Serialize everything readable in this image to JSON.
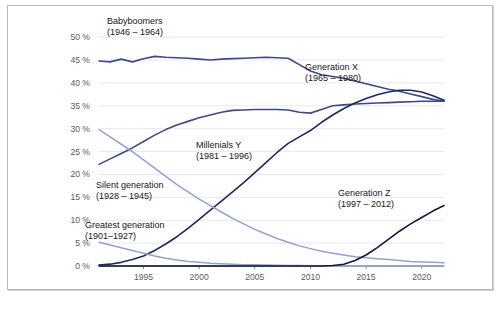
{
  "figure": {
    "background": "#ffffff",
    "frame_color": "#b9b9b9"
  },
  "chart_data": {
    "type": "line",
    "title": "",
    "subtitle": "",
    "xlabel": "",
    "ylabel": "",
    "xlim": [
      1991,
      2022
    ],
    "ylim": [
      0,
      52
    ],
    "grid": true,
    "legend_position": "inline-annotations",
    "y_ticks": [
      "0 %",
      "5 %",
      "10 %",
      "15 %",
      "20 %",
      "25 %",
      "30 %",
      "35 %",
      "40 %",
      "45 %",
      "50 %"
    ],
    "y_tick_values": [
      0,
      5,
      10,
      15,
      20,
      25,
      30,
      35,
      40,
      45,
      50
    ],
    "x_ticks": [
      "1995",
      "2000",
      "2005",
      "2010",
      "2015",
      "2020"
    ],
    "x_tick_values": [
      1995,
      2000,
      2005,
      2010,
      2015,
      2020
    ],
    "x": [
      1991,
      1992,
      1993,
      1994,
      1995,
      1996,
      1997,
      1998,
      1999,
      2000,
      2001,
      2002,
      2003,
      2004,
      2005,
      2006,
      2007,
      2008,
      2009,
      2010,
      2011,
      2012,
      2013,
      2014,
      2015,
      2016,
      2017,
      2018,
      2019,
      2020,
      2021,
      2022
    ],
    "series": [
      {
        "name": "Babyboomers",
        "years": "(1946 – 1964)",
        "color": "#3b4a86",
        "width": 1.6,
        "values": [
          44.8,
          44.6,
          45.2,
          44.6,
          45.3,
          45.8,
          45.6,
          45.5,
          45.4,
          45.2,
          45.0,
          45.2,
          45.3,
          45.4,
          45.5,
          45.6,
          45.5,
          45.4,
          44.0,
          42.6,
          41.8,
          41.4,
          41.0,
          40.4,
          39.8,
          39.2,
          38.6,
          38.2,
          37.6,
          37.0,
          36.4,
          36.0
        ]
      },
      {
        "name": "Generation X",
        "years": "(1965 – 1980)",
        "color": "#3b4a86",
        "width": 1.6,
        "values": [
          22.2,
          23.4,
          24.6,
          25.8,
          27.2,
          28.6,
          29.8,
          30.8,
          31.6,
          32.4,
          33.0,
          33.6,
          34.0,
          34.1,
          34.2,
          34.2,
          34.2,
          34.1,
          33.6,
          33.4,
          34.2,
          35.0,
          35.2,
          35.4,
          35.5,
          35.6,
          35.7,
          35.8,
          35.9,
          36.0,
          36.0,
          36.0
        ]
      },
      {
        "name": "Millenials Y",
        "years": "(1981 – 1996)",
        "color": "#1f2a5e",
        "width": 1.6,
        "values": [
          0.2,
          0.4,
          0.8,
          1.4,
          2.2,
          3.4,
          4.8,
          6.4,
          8.2,
          10.2,
          12.2,
          14.2,
          16.2,
          18.2,
          20.4,
          22.6,
          24.8,
          26.8,
          28.2,
          29.6,
          31.4,
          33.0,
          34.4,
          35.6,
          36.6,
          37.4,
          38.0,
          38.4,
          38.4,
          38.0,
          37.2,
          36.2
        ]
      },
      {
        "name": "Silent generation",
        "years": "(1928 – 1945)",
        "color": "#8fa4cc",
        "width": 1.5,
        "values": [
          29.8,
          28.2,
          26.6,
          25.0,
          23.2,
          21.4,
          19.6,
          17.8,
          16.2,
          14.6,
          13.2,
          11.8,
          10.4,
          9.2,
          8.0,
          7.0,
          6.0,
          5.2,
          4.4,
          3.8,
          3.2,
          2.8,
          2.4,
          2.0,
          1.8,
          1.6,
          1.4,
          1.2,
          1.0,
          0.9,
          0.8,
          0.7
        ]
      },
      {
        "name": "Greatest generation",
        "years": "(1901–1927)",
        "color": "#8fa4cc",
        "width": 1.5,
        "values": [
          5.2,
          4.6,
          4.0,
          3.4,
          2.8,
          2.2,
          1.7,
          1.3,
          1.0,
          0.8,
          0.6,
          0.5,
          0.4,
          0.3,
          0.25,
          0.2,
          0.15,
          0.12,
          0.1,
          0.08,
          0.06,
          0.05,
          0.04,
          0.03,
          0.02,
          0.02,
          0.01,
          0.01,
          0.0,
          0.0,
          0.0,
          0.0
        ]
      },
      {
        "name": "Generation Z",
        "years": "(1997 – 2012)",
        "color": "#101a3d",
        "width": 1.6,
        "values": [
          0,
          0,
          0,
          0,
          0,
          0,
          0,
          0,
          0,
          0,
          0,
          0,
          0,
          0,
          0,
          0,
          0,
          0,
          0,
          0,
          0,
          0.1,
          0.4,
          1.2,
          2.4,
          4.0,
          5.8,
          7.6,
          9.2,
          10.6,
          12.0,
          13.2
        ]
      }
    ],
    "annotations": [
      {
        "name": "babyboomers",
        "label": "Babyboomers",
        "sub": "(1946 – 1964)",
        "x": 107,
        "y": 24
      },
      {
        "name": "generation-x",
        "label": "Generation X",
        "sub": "(1965 – 1980)",
        "x": 305,
        "y": 70
      },
      {
        "name": "millenials-y",
        "label": "Millenials Y",
        "sub": "(1981 – 1996)",
        "x": 196,
        "y": 148
      },
      {
        "name": "silent-generation",
        "label": "Silent generation",
        "sub": "(1928 – 1945)",
        "x": 96,
        "y": 188
      },
      {
        "name": "greatest-generation",
        "label": "Greatest generation",
        "sub": "(1901–1927)",
        "x": 85,
        "y": 228
      },
      {
        "name": "generation-z",
        "label": "Generation Z",
        "sub": "(1997 – 2012)",
        "x": 338,
        "y": 196
      }
    ]
  }
}
